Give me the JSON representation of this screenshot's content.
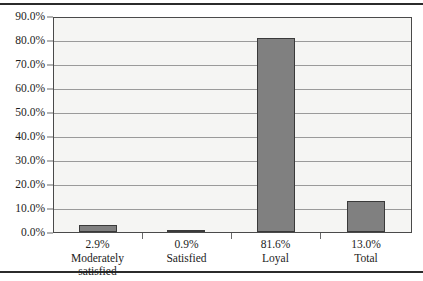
{
  "chart_data": {
    "type": "bar",
    "title": "",
    "xlabel": "",
    "ylabel": "",
    "categories": [
      "Moderately satisfied",
      "Satisfied",
      "Loyal",
      "Total"
    ],
    "category_lines": [
      [
        "Moderately",
        "satisfied"
      ],
      [
        "Satisfied"
      ],
      [
        "Loyal"
      ],
      [
        "Total"
      ]
    ],
    "values": [
      2.9,
      0.9,
      81.6,
      13.0
    ],
    "data_labels": [
      "2.9%",
      "0.9%",
      "81.6%",
      "13.0%"
    ],
    "ylim": [
      0,
      90
    ],
    "ytick_values": [
      0,
      10,
      20,
      30,
      40,
      50,
      60,
      70,
      80,
      90
    ],
    "ytick_labels": [
      "0.0%",
      "10.0%",
      "20.0%",
      "30.0%",
      "40.0%",
      "50.0%",
      "60.0%",
      "70.0%",
      "80.0%",
      "90.0%"
    ],
    "grid": true,
    "legend": "none",
    "bar_color": "#808080",
    "bar_border_color": "#3a3a3a",
    "plot_background": "#f5f5f3",
    "gridline_color": "#9a9a9a",
    "axis_color": "#4a4a4a",
    "text_color": "#1c1c1c"
  }
}
